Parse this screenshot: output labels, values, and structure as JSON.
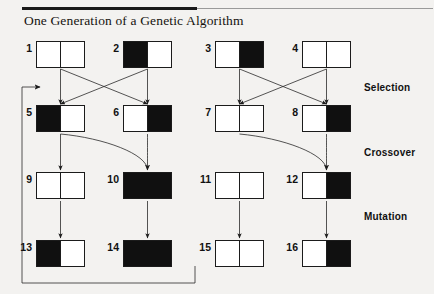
{
  "figure": {
    "title": "One Generation of a Genetic Algorithm",
    "rule_color": "#1a1a1a",
    "background": "#f3f2f0",
    "ink": "#101010"
  },
  "stage_labels": [
    {
      "name": "selection",
      "text": "Selection",
      "x": 364,
      "y": 82
    },
    {
      "name": "crossover",
      "text": "Crossover",
      "x": 364,
      "y": 147
    },
    {
      "name": "mutation",
      "text": "Mutation",
      "x": 364,
      "y": 211
    }
  ],
  "rows": [
    {
      "name": "initial-population",
      "y": 41,
      "boxes": [
        {
          "id": "1",
          "x": 36,
          "left": "white",
          "right": "white"
        },
        {
          "id": "2",
          "x": 123,
          "left": "black",
          "right": "white"
        },
        {
          "id": "3",
          "x": 215,
          "left": "white",
          "right": "black"
        },
        {
          "id": "4",
          "x": 302,
          "left": "white",
          "right": "white"
        }
      ]
    },
    {
      "name": "selected-population",
      "y": 105,
      "boxes": [
        {
          "id": "5",
          "x": 36,
          "left": "black",
          "right": "white"
        },
        {
          "id": "6",
          "x": 123,
          "left": "white",
          "right": "black"
        },
        {
          "id": "7",
          "x": 215,
          "left": "white",
          "right": "white"
        },
        {
          "id": "8",
          "x": 302,
          "left": "white",
          "right": "black"
        }
      ]
    },
    {
      "name": "crossover-offspring",
      "y": 172,
      "boxes": [
        {
          "id": "9",
          "x": 36,
          "left": "white",
          "right": "white"
        },
        {
          "id": "10",
          "x": 123,
          "left": "black",
          "right": "black"
        },
        {
          "id": "11",
          "x": 215,
          "left": "white",
          "right": "white"
        },
        {
          "id": "12",
          "x": 302,
          "left": "white",
          "right": "black"
        }
      ]
    },
    {
      "name": "mutated-offspring",
      "y": 240,
      "boxes": [
        {
          "id": "13",
          "x": 36,
          "left": "black",
          "right": "white"
        },
        {
          "id": "14",
          "x": 123,
          "left": "black",
          "right": "black"
        },
        {
          "id": "15",
          "x": 215,
          "left": "white",
          "right": "white"
        },
        {
          "id": "16",
          "x": 302,
          "left": "white",
          "right": "black"
        }
      ]
    }
  ],
  "box_geometry": {
    "width": 49,
    "height": 27
  },
  "selection_arrows": [
    {
      "from": "1",
      "to": "5"
    },
    {
      "from": "2",
      "to": "6"
    },
    {
      "from": "3",
      "to": "7"
    },
    {
      "from": "4",
      "to": "8"
    },
    {
      "from": "1",
      "to": "6"
    },
    {
      "from": "2",
      "to": "5"
    },
    {
      "from": "3",
      "to": "8"
    },
    {
      "from": "4",
      "to": "7"
    }
  ],
  "crossover_arrows": [
    {
      "parents": [
        "5",
        "6"
      ],
      "child": "10"
    },
    {
      "parents": [
        "7",
        "8"
      ],
      "child": "12"
    }
  ],
  "vertical_arrows": [
    {
      "from": "5",
      "to": "9"
    },
    {
      "from": "9",
      "to": "13"
    },
    {
      "from": "10",
      "to": "14"
    },
    {
      "from": "11",
      "to": "15"
    },
    {
      "from": "12",
      "to": "16"
    }
  ],
  "feedback_loop": {
    "name": "generation-feedback-loop",
    "description": "loop from mutated population back to selection"
  }
}
